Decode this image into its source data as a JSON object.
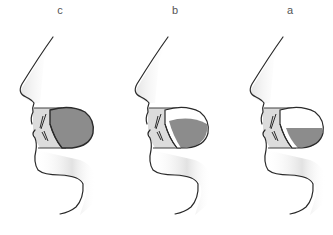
{
  "figure": {
    "panels": [
      {
        "label": "c",
        "tongue_fill": "full",
        "offset_x": 0
      },
      {
        "label": "b",
        "tongue_fill": "partial",
        "offset_x": 115
      },
      {
        "label": "a",
        "tongue_fill": "low",
        "offset_x": 230
      }
    ]
  },
  "colors": {
    "outline": "#2a2a2a",
    "tongue": "#8c8c8c",
    "lip_shade": "#d9d9d9",
    "skin_shadow": "#e6e6e6",
    "label": "#555555"
  }
}
